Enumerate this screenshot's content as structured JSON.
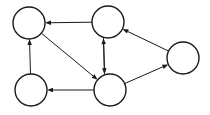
{
  "diagram": {
    "type": "directed-graph",
    "background_color": "#ffffff",
    "stroke_color": "#1a1a1a",
    "node_fill_color": "#ffffff",
    "node_stroke_width": 1.4,
    "edge_stroke_width": 1.0,
    "arrowhead_length": 6,
    "arrowhead_width": 4.5,
    "canvas": {
      "width": 210,
      "height": 115
    },
    "nodes": [
      {
        "id": "n1",
        "label": "",
        "name": "node-top-left",
        "cx": 29,
        "cy": 23,
        "r": 16
      },
      {
        "id": "n2",
        "label": "",
        "name": "node-top-middle",
        "cx": 108,
        "cy": 22,
        "r": 16
      },
      {
        "id": "n3",
        "label": "",
        "name": "node-bottom-left",
        "cx": 31,
        "cy": 90,
        "r": 16
      },
      {
        "id": "n4",
        "label": "",
        "name": "node-bottom-middle",
        "cx": 110,
        "cy": 90,
        "r": 16
      },
      {
        "id": "n5",
        "label": "",
        "name": "node-right",
        "cx": 183,
        "cy": 58,
        "r": 16
      }
    ],
    "edges": [
      {
        "id": "e1",
        "name": "edge-top-middle-to-top-left",
        "from": "n2",
        "to": "n1",
        "directed": true
      },
      {
        "id": "e2",
        "name": "edge-bottom-left-to-top-left",
        "from": "n3",
        "to": "n1",
        "directed": true
      },
      {
        "id": "e3",
        "name": "edge-top-left-to-bottom-middle",
        "from": "n1",
        "to": "n4",
        "directed": true
      },
      {
        "id": "e4",
        "name": "edge-top-middle-to-bottom-middle",
        "from": "n2",
        "to": "n4",
        "directed": true,
        "offset": 5
      },
      {
        "id": "e5",
        "name": "edge-bottom-middle-to-top-middle",
        "from": "n4",
        "to": "n2",
        "directed": true,
        "offset": -5
      },
      {
        "id": "e6",
        "name": "edge-bottom-middle-to-bottom-left",
        "from": "n4",
        "to": "n3",
        "directed": true
      },
      {
        "id": "e7",
        "name": "edge-bottom-middle-to-right",
        "from": "n4",
        "to": "n5",
        "directed": true
      },
      {
        "id": "e8",
        "name": "edge-right-to-top-middle",
        "from": "n5",
        "to": "n2",
        "directed": true
      }
    ]
  }
}
